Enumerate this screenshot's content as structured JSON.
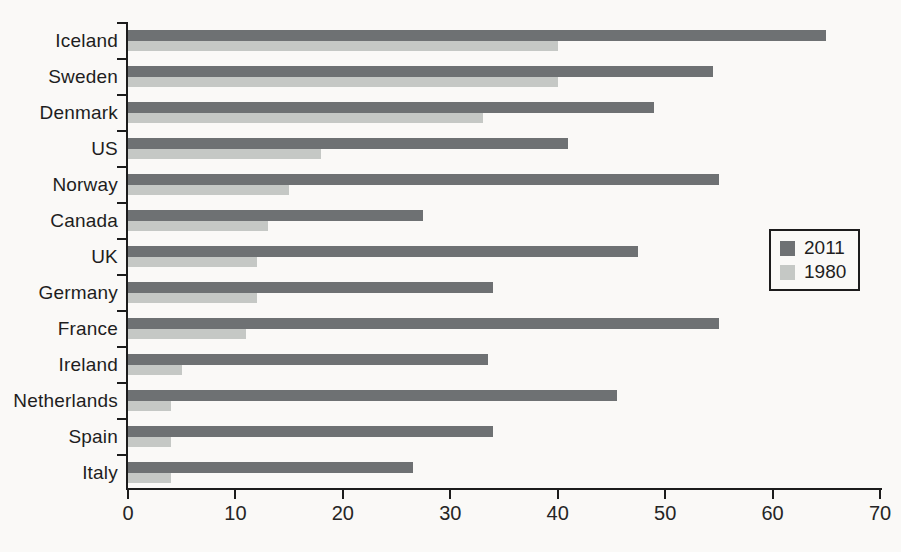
{
  "chart_data": {
    "type": "bar",
    "orientation": "horizontal",
    "title": "",
    "xlabel": "",
    "ylabel": "",
    "xlim": [
      0,
      70
    ],
    "x_ticks": [
      0,
      10,
      20,
      30,
      40,
      50,
      60,
      70
    ],
    "grid": false,
    "legend_position": "right-middle",
    "categories": [
      "Iceland",
      "Sweden",
      "Denmark",
      "US",
      "Norway",
      "Canada",
      "UK",
      "Germany",
      "France",
      "Ireland",
      "Netherlands",
      "Spain",
      "Italy"
    ],
    "series": [
      {
        "name": "2011",
        "color": "#6e7173",
        "values": [
          65,
          54.5,
          49,
          41,
          55,
          27.5,
          47.5,
          34,
          55,
          33.5,
          45.5,
          34,
          26.5
        ]
      },
      {
        "name": "1980",
        "color": "#c5c8c5",
        "values": [
          40,
          40,
          33,
          18,
          15,
          13,
          12,
          12,
          11,
          5,
          4,
          4,
          4
        ]
      }
    ]
  },
  "colors": {
    "background": "#faf9f7",
    "axis": "#1c1c1c",
    "text": "#1e1e1e"
  }
}
